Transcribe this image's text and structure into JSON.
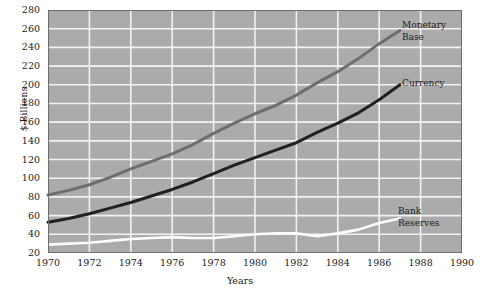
{
  "chart_data": {
    "type": "line",
    "title": "",
    "xlabel": "Years",
    "ylabel": "$ Billions",
    "xlim": [
      1970,
      1990
    ],
    "ylim": [
      20,
      280
    ],
    "xticks": [
      1970,
      1972,
      1974,
      1976,
      1978,
      1980,
      1982,
      1984,
      1986,
      1988,
      1990
    ],
    "yticks": [
      20,
      40,
      60,
      80,
      100,
      120,
      140,
      160,
      180,
      200,
      220,
      240,
      260,
      280
    ],
    "grid": true,
    "legend_position": "inline-right",
    "plot_background": "#ababab",
    "grid_color": "#f2f2f2",
    "x": [
      1970,
      1971,
      1972,
      1973,
      1974,
      1975,
      1976,
      1977,
      1978,
      1979,
      1980,
      1981,
      1982,
      1983,
      1984,
      1985,
      1986,
      1987
    ],
    "series": [
      {
        "name": "Monetary Base",
        "color": "#6e6e6e",
        "values": [
          82,
          87,
          93,
          101,
          110,
          118,
          126,
          136,
          148,
          159,
          169,
          178,
          189,
          202,
          214,
          228,
          244,
          258
        ]
      },
      {
        "name": "Currency",
        "color": "#211f1f",
        "values": [
          53,
          57,
          62,
          68,
          74,
          81,
          88,
          96,
          105,
          114,
          122,
          130,
          138,
          149,
          159,
          170,
          184,
          200
        ]
      },
      {
        "name": "Bank Reserves",
        "color": "#fdfdfd",
        "values": [
          29,
          30,
          31,
          33,
          35,
          36,
          37,
          36,
          36,
          38,
          40,
          41,
          41,
          38,
          41,
          45,
          52,
          57
        ]
      }
    ],
    "annotations": [
      {
        "text_line1": "Monetary",
        "text_line2": "Base"
      },
      {
        "text_line1": "Currency",
        "text_line2": ""
      },
      {
        "text_line1": "Bank",
        "text_line2": "Reserves"
      }
    ]
  }
}
